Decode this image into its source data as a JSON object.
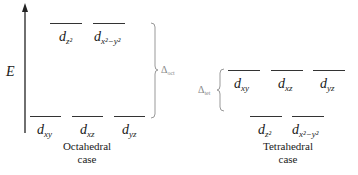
{
  "axis": {
    "label": "E"
  },
  "octahedral": {
    "caption_line1": "Octahedral",
    "caption_line2": "case",
    "upper": [
      {
        "base": "d",
        "sub": "z²"
      },
      {
        "base": "d",
        "sub": "x²−y²"
      }
    ],
    "lower": [
      {
        "base": "d",
        "sub": "xy"
      },
      {
        "base": "d",
        "sub": "xz"
      },
      {
        "base": "d",
        "sub": "yz"
      }
    ],
    "splitting": {
      "symbol": "Δ",
      "sub": "oct"
    }
  },
  "tetrahedral": {
    "caption_line1": "Tetrahedral",
    "caption_line2": "case",
    "upper": [
      {
        "base": "d",
        "sub": "xy"
      },
      {
        "base": "d",
        "sub": "xz"
      },
      {
        "base": "d",
        "sub": "yz"
      }
    ],
    "lower": [
      {
        "base": "d",
        "sub": "z²"
      },
      {
        "base": "d",
        "sub": "x²−y²"
      }
    ],
    "splitting": {
      "symbol": "Δ",
      "sub": "tet"
    }
  }
}
